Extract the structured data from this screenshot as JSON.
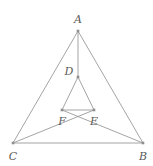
{
  "figure": {
    "width": 153,
    "height": 166,
    "background_color": "#ffffff",
    "stroke_color": "#9a9a9a",
    "point_color": "#8f8f8f",
    "label_color": "#5a5a5a",
    "stroke_width": 0.9,
    "point_size": 2.6
  },
  "points": [
    {
      "id": "A",
      "label": "A",
      "x": 78,
      "y": 31,
      "label_x": 78,
      "label_y": 19
    },
    {
      "id": "D",
      "label": "D",
      "x": 78,
      "y": 77,
      "label_x": 69,
      "label_y": 71
    },
    {
      "id": "F",
      "label": "F",
      "x": 62,
      "y": 110,
      "label_x": 62,
      "label_y": 121
    },
    {
      "id": "E",
      "label": "E",
      "x": 94,
      "y": 110,
      "label_x": 94,
      "label_y": 121
    },
    {
      "id": "C",
      "label": "C",
      "x": 13,
      "y": 143,
      "label_x": 13,
      "label_y": 156
    },
    {
      "id": "B",
      "label": "B",
      "x": 143,
      "y": 143,
      "label_x": 143,
      "label_y": 156
    }
  ],
  "segments": [
    {
      "name": "segment-AC",
      "from": "A",
      "to": "C"
    },
    {
      "name": "segment-AB",
      "from": "A",
      "to": "B"
    },
    {
      "name": "segment-CB",
      "from": "C",
      "to": "B"
    },
    {
      "name": "segment-AD",
      "from": "A",
      "to": "D"
    },
    {
      "name": "segment-DF",
      "from": "D",
      "to": "F"
    },
    {
      "name": "segment-DE",
      "from": "D",
      "to": "E"
    },
    {
      "name": "segment-FE",
      "from": "F",
      "to": "E"
    },
    {
      "name": "segment-CE",
      "from": "C",
      "to": "E"
    },
    {
      "name": "segment-BF",
      "from": "B",
      "to": "F"
    }
  ]
}
